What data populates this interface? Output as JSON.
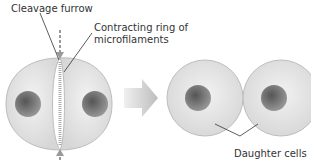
{
  "labels": {
    "cleavage_furrow": "Cleavage furrow",
    "contracting_ring_line1": "Contracting ring of",
    "contracting_ring_line2": "microfilaments",
    "daughter_cells": "Daughter cells"
  },
  "colors": {
    "cell_fill": "#e4e4e4",
    "cell_edge": "#b8b8b8",
    "nucleus": "#7a7a7a",
    "arrow": "#c8c8c8",
    "line": "#333333"
  }
}
